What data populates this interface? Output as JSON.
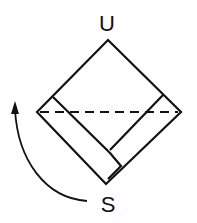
{
  "labels": {
    "top": "U",
    "bottom": "S"
  },
  "colors": {
    "stroke": "#111111",
    "background": "#ffffff"
  },
  "shapes": {
    "square": "rotated-square-diamond",
    "band": "folded-strip-along-lower-left-edge",
    "fold_line": "dashed-horizontal-diagonal",
    "arrow": "curved-rotation-arrow-upward"
  }
}
